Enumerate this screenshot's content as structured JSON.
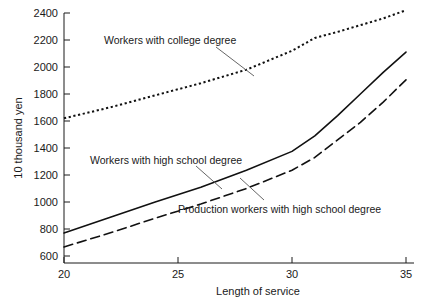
{
  "chart_data": {
    "type": "line",
    "title": "",
    "xlabel": "Length of service",
    "ylabel": "10 thousand yen",
    "xlim": [
      20,
      35
    ],
    "ylim": [
      600,
      2400
    ],
    "xticks": [
      20,
      25,
      30,
      35
    ],
    "yticks": [
      600,
      800,
      1000,
      1200,
      1400,
      1600,
      1800,
      2000,
      2200,
      2400
    ],
    "grid": false,
    "legend_position": "inline-annotations",
    "series": [
      {
        "name": "Workers with college degree",
        "style": "dotted",
        "x": [
          20,
          22,
          24,
          26,
          28,
          30,
          31,
          32,
          33,
          34,
          35
        ],
        "values": [
          1620,
          1700,
          1790,
          1880,
          1980,
          2120,
          2215,
          2260,
          2310,
          2360,
          2420
        ]
      },
      {
        "name": "Workers with high school degree",
        "style": "solid",
        "x": [
          20,
          22,
          24,
          26,
          28,
          30,
          31,
          32,
          33,
          34,
          35
        ],
        "values": [
          770,
          885,
          1000,
          1110,
          1235,
          1375,
          1490,
          1640,
          1800,
          1960,
          2110
        ]
      },
      {
        "name": "Production workers with high school degree",
        "style": "dashed",
        "x": [
          20,
          22,
          24,
          26,
          28,
          30,
          31,
          32,
          33,
          34,
          35
        ],
        "values": [
          667,
          770,
          880,
          985,
          1100,
          1235,
          1330,
          1460,
          1590,
          1740,
          1905
        ]
      }
    ],
    "annotations": [
      {
        "text": "Workers with college degree",
        "x": 23.2,
        "y": 2205
      },
      {
        "text": "Workers with high school degree",
        "x": 24.6,
        "y": 1305
      },
      {
        "text": "Production workers with high school degree",
        "x": 28.6,
        "y": 955
      }
    ]
  },
  "axis": {
    "y_title": "10 thousand yen",
    "x_title": "Length of service",
    "x_tick_labels": [
      "20",
      "25",
      "30",
      "35"
    ],
    "y_tick_labels": [
      "600",
      "800",
      "1000",
      "1200",
      "1400",
      "1600",
      "1800",
      "2000",
      "2200",
      "2400"
    ]
  },
  "colors": {
    "ink": "#111111",
    "background": "#ffffff",
    "leader": "#555555"
  }
}
